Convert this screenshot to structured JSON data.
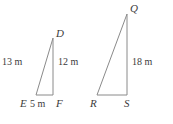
{
  "figure": {
    "stroke_color": "#8a8a8a",
    "text_color": "#3b3b3b",
    "background_color": "#ffffff",
    "units": "m"
  },
  "triangles": [
    {
      "name": "triangle-DEF",
      "vertices": [
        {
          "label": "D",
          "x": 53,
          "y": 38
        },
        {
          "label": "E",
          "x": 36,
          "y": 95
        },
        {
          "label": "F",
          "x": 53,
          "y": 95
        }
      ],
      "sides": [
        {
          "name": "hypotenuse-DE",
          "label": "13 m",
          "value": 13
        },
        {
          "name": "vertical-DF",
          "label": "12 m",
          "value": 12
        },
        {
          "name": "base-EF",
          "label": "5 m",
          "value": 5
        }
      ]
    },
    {
      "name": "triangle-QRS",
      "vertices": [
        {
          "label": "Q",
          "x": 127,
          "y": 14
        },
        {
          "label": "R",
          "x": 97,
          "y": 95
        },
        {
          "label": "S",
          "x": 127,
          "y": 95
        }
      ],
      "sides": [
        {
          "name": "vertical-QS",
          "label": "18 m",
          "value": 18
        }
      ]
    }
  ],
  "labels": {
    "D": "D",
    "E": "E",
    "F": "F",
    "Q": "Q",
    "R": "R",
    "S": "S",
    "len_13m": "13 m",
    "len_12m": "12 m",
    "len_5m": "5 m",
    "len_18m": "18 m"
  }
}
